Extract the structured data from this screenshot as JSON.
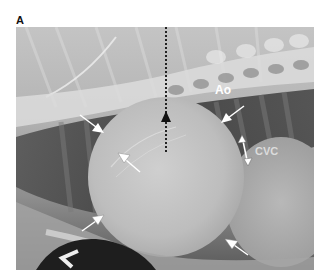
{
  "figure": {
    "panel_label": "A",
    "image_description": "Lateral thoracic radiograph showing enlarged globoid cardiac silhouette",
    "annotations": {
      "aorta_label": "Ao",
      "cvc_label": "CVC",
      "side_marker": "L"
    },
    "colors": {
      "annotation_text": "#ffffff",
      "cvc_text": "#dcdcdc",
      "arrow_fill": "#ffffff",
      "dashed_arrow": "#111111"
    }
  }
}
